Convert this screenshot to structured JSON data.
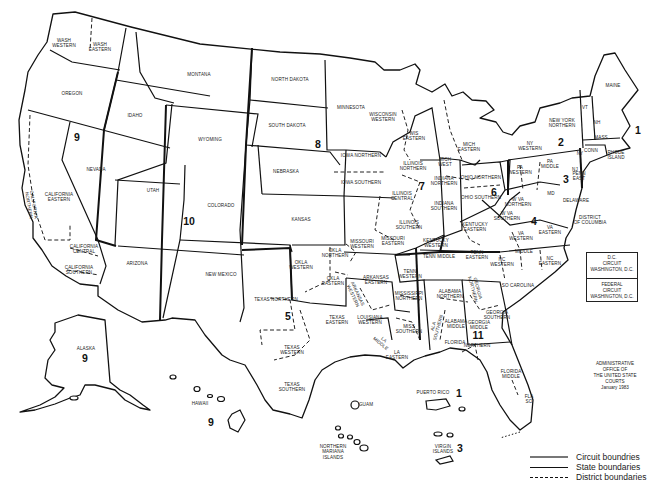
{
  "map": {
    "title": "Geographic Boundaries of United States Courts of Appeals and United States District Courts",
    "colors": {
      "background": "#ffffff",
      "lines": "#111111",
      "text": "#222222"
    },
    "circuits": [
      {
        "number": "1",
        "x": 638,
        "y": 130
      },
      {
        "number": "2",
        "x": 561,
        "y": 142
      },
      {
        "number": "3",
        "x": 566,
        "y": 179
      },
      {
        "number": "4",
        "x": 534,
        "y": 221
      },
      {
        "number": "5",
        "x": 288,
        "y": 316
      },
      {
        "number": "6",
        "x": 494,
        "y": 192
      },
      {
        "number": "7",
        "x": 422,
        "y": 186
      },
      {
        "number": "8",
        "x": 318,
        "y": 144
      },
      {
        "number": "9",
        "x": 77,
        "y": 137
      },
      {
        "number": "10",
        "x": 189,
        "y": 221
      },
      {
        "number": "11",
        "x": 478,
        "y": 335
      },
      {
        "number": "9",
        "x": 85,
        "y": 358
      },
      {
        "number": "9",
        "x": 211,
        "y": 422
      },
      {
        "number": "1",
        "x": 459,
        "y": 393
      },
      {
        "number": "3",
        "x": 460,
        "y": 448
      }
    ],
    "district_labels": [
      {
        "text": "WASH\nWESTERN",
        "x": 64,
        "y": 43
      },
      {
        "text": "WASH\nEASTERN",
        "x": 100,
        "y": 47
      },
      {
        "text": "OREGON",
        "x": 72,
        "y": 94
      },
      {
        "text": "IDAHO",
        "x": 135,
        "y": 116
      },
      {
        "text": "MONTANA",
        "x": 199,
        "y": 75
      },
      {
        "text": "WYOMING",
        "x": 210,
        "y": 140
      },
      {
        "text": "NORTH DAKOTA",
        "x": 290,
        "y": 80
      },
      {
        "text": "SOUTH DAKOTA",
        "x": 287,
        "y": 126
      },
      {
        "text": "MINNESOTA",
        "x": 351,
        "y": 108
      },
      {
        "text": "NEVADA",
        "x": 96,
        "y": 170
      },
      {
        "text": "CALIFORNIA\nEASTERN",
        "x": 59,
        "y": 197
      },
      {
        "text": "CALIFORNIA\nNORTHERN",
        "x": 31,
        "y": 205,
        "rotate": 80
      },
      {
        "text": "CALIFORNIA\nCENTRAL",
        "x": 84,
        "y": 249
      },
      {
        "text": "CALIFORNIA\nSOUTHERN",
        "x": 79,
        "y": 270
      },
      {
        "text": "UTAH",
        "x": 153,
        "y": 191
      },
      {
        "text": "COLORADO",
        "x": 221,
        "y": 206
      },
      {
        "text": "ARIZONA",
        "x": 137,
        "y": 264
      },
      {
        "text": "NEW MEXICO",
        "x": 221,
        "y": 275
      },
      {
        "text": "NEBRASKA",
        "x": 286,
        "y": 172
      },
      {
        "text": "KANSAS",
        "x": 301,
        "y": 220
      },
      {
        "text": "IOWA NORTHERN",
        "x": 361,
        "y": 156
      },
      {
        "text": "IOWA SOUTHERN",
        "x": 361,
        "y": 183
      },
      {
        "text": "WISCONSIN\nWESTERN",
        "x": 383,
        "y": 117
      },
      {
        "text": "WIS\nEASTERN",
        "x": 414,
        "y": 136
      },
      {
        "text": "MICH\nEASTERN",
        "x": 469,
        "y": 147
      },
      {
        "text": "MICH\nWEST",
        "x": 445,
        "y": 162
      },
      {
        "text": "ILLINOIS\nNORTHERN",
        "x": 413,
        "y": 166
      },
      {
        "text": "ILLINOIS\nCENTRAL",
        "x": 402,
        "y": 196
      },
      {
        "text": "ILLINOIS\nSOUTHERN",
        "x": 409,
        "y": 225
      },
      {
        "text": "INDIANA\nNORTHERN",
        "x": 444,
        "y": 181
      },
      {
        "text": "INDIANA\nSOUTHERN",
        "x": 444,
        "y": 206
      },
      {
        "text": "OHIO NORTHERN",
        "x": 481,
        "y": 178
      },
      {
        "text": "OHIO SOUTHERN",
        "x": 481,
        "y": 198
      },
      {
        "text": "PA\nWESTERN",
        "x": 520,
        "y": 170
      },
      {
        "text": "PA\nMIDDLE",
        "x": 550,
        "y": 164
      },
      {
        "text": "PENN\nEAST",
        "x": 579,
        "y": 176
      },
      {
        "text": "NY\nWESTERN",
        "x": 530,
        "y": 146
      },
      {
        "text": "NEW YORK\nNORTHERN",
        "x": 562,
        "y": 123
      },
      {
        "text": "NY",
        "x": 580,
        "y": 154
      },
      {
        "text": "NJ",
        "x": 575,
        "y": 170
      },
      {
        "text": "VT",
        "x": 585,
        "y": 108
      },
      {
        "text": "NH",
        "x": 597,
        "y": 123
      },
      {
        "text": "MAINE",
        "x": 613,
        "y": 86
      },
      {
        "text": "MASS",
        "x": 601,
        "y": 138
      },
      {
        "text": "CONN",
        "x": 591,
        "y": 151
      },
      {
        "text": "RHODE\nISLAND",
        "x": 616,
        "y": 155
      },
      {
        "text": "MD",
        "x": 551,
        "y": 194
      },
      {
        "text": "DELAWARE",
        "x": 576,
        "y": 201
      },
      {
        "text": "DISTRICT\nOF COLUMBIA",
        "x": 590,
        "y": 220
      },
      {
        "text": "W VA\nNORTHERN",
        "x": 518,
        "y": 202
      },
      {
        "text": "W VA\nSOUTHERN",
        "x": 507,
        "y": 216
      },
      {
        "text": "VA\nWESTERN",
        "x": 521,
        "y": 236
      },
      {
        "text": "VA\nEASTERN",
        "x": 550,
        "y": 230
      },
      {
        "text": "KENTUCKY\nEASTERN",
        "x": 475,
        "y": 227
      },
      {
        "text": "KENTUCKY\nWESTERN",
        "x": 436,
        "y": 243
      },
      {
        "text": "TENN MIDDLE",
        "x": 439,
        "y": 257
      },
      {
        "text": "TENN\nEASTERN",
        "x": 477,
        "y": 255
      },
      {
        "text": "TENN\nWESTERN",
        "x": 410,
        "y": 274
      },
      {
        "text": "NC\nWESTERN",
        "x": 502,
        "y": 262
      },
      {
        "text": "MIDDLE",
        "x": 524,
        "y": 252
      },
      {
        "text": "NC\nEASTERN",
        "x": 550,
        "y": 261
      },
      {
        "text": "SO CAROLINA",
        "x": 518,
        "y": 286
      },
      {
        "text": "MISSOURI\nWESTERN",
        "x": 362,
        "y": 244
      },
      {
        "text": "MISSOURI\nEASTERN",
        "x": 393,
        "y": 241
      },
      {
        "text": "OKLA\nNORTHERN",
        "x": 335,
        "y": 253
      },
      {
        "text": "OKLA\nWESTERN",
        "x": 301,
        "y": 265
      },
      {
        "text": "OKLA\nEASTERN",
        "x": 333,
        "y": 281
      },
      {
        "text": "ARKANSAS\nEASTERN",
        "x": 376,
        "y": 280
      },
      {
        "text": "ARKANSAS\nWESTERN",
        "x": 355,
        "y": 295,
        "rotate": 65
      },
      {
        "text": "MISSISSIPPI\nNORTHERN",
        "x": 409,
        "y": 296
      },
      {
        "text": "MISS\nSOUTHERN",
        "x": 409,
        "y": 329
      },
      {
        "text": "ALABAMA\nNORTHERN",
        "x": 450,
        "y": 294
      },
      {
        "text": "ALABAMA\nMIDDLE",
        "x": 456,
        "y": 324
      },
      {
        "text": "ALA\nSOUTHERN",
        "x": 436,
        "y": 327,
        "rotate": -75
      },
      {
        "text": "GEORGIA\nNORTHERN",
        "x": 475,
        "y": 289,
        "rotate": 75
      },
      {
        "text": "GEORGIA\nMIDDLE",
        "x": 479,
        "y": 325
      },
      {
        "text": "GEORGIA\nSOUTHERN",
        "x": 497,
        "y": 315
      },
      {
        "text": "FLORIDA",
        "x": 455,
        "y": 343
      },
      {
        "text": "NORTHERN",
        "x": 477,
        "y": 346
      },
      {
        "text": "FLORIDA\nMIDDLE",
        "x": 511,
        "y": 374
      },
      {
        "text": "FLA\nSO",
        "x": 529,
        "y": 399
      },
      {
        "text": "TEXAS NORTHERN",
        "x": 276,
        "y": 300
      },
      {
        "text": "TEXAS\nEASTERN",
        "x": 337,
        "y": 320
      },
      {
        "text": "TEXAS\nWESTERN",
        "x": 292,
        "y": 350
      },
      {
        "text": "TEXAS\nSOUTHERN",
        "x": 292,
        "y": 387
      },
      {
        "text": "LOUISIANA\nWESTERN",
        "x": 370,
        "y": 320
      },
      {
        "text": "LA\nMIDDLE",
        "x": 382,
        "y": 342,
        "rotate": 40
      },
      {
        "text": "LA\nEASTERN",
        "x": 397,
        "y": 355
      },
      {
        "text": "ALASKA",
        "x": 86,
        "y": 349
      },
      {
        "text": "HAWAII",
        "x": 200,
        "y": 404
      },
      {
        "text": "GUAM",
        "x": 366,
        "y": 405
      },
      {
        "text": "NORTHERN\nMARIANA\nISLANDS",
        "x": 333,
        "y": 452
      },
      {
        "text": "PUERTO RICO",
        "x": 433,
        "y": 393
      },
      {
        "text": "VIRGIN\nISLANDS",
        "x": 443,
        "y": 449
      }
    ],
    "dc_boxes": [
      {
        "text": "D.C.\nCIRCUIT\nWASHINGTON, D.C."
      },
      {
        "text": "FEDERAL\nCIRCUIT\nWASHINGTON, D.C."
      }
    ],
    "credit": "ADMINISTRATIVE OFFICE OF\nTHE UNITED STATE COURTS\nJanuary 1983",
    "legend": [
      {
        "style": "circuit",
        "label": "Circuit boundries"
      },
      {
        "style": "state",
        "label": "State boundaries"
      },
      {
        "style": "district",
        "label": "District boundaries"
      }
    ]
  }
}
